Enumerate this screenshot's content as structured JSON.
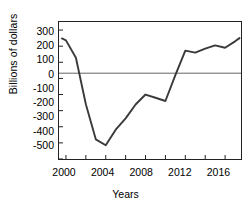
{
  "chart_data": {
    "type": "line",
    "title": "",
    "xlabel": "Years",
    "ylabel": "Billions of dollars",
    "xlim": [
      1999.3,
      2017.6
    ],
    "ylim": [
      -500,
      350
    ],
    "grid": false,
    "legend": "none",
    "zero_line": 0,
    "x_ticks_major": [
      2000,
      2004,
      2008,
      2012,
      2016
    ],
    "x_ticks_minor": [
      2002,
      2006,
      2010,
      2014
    ],
    "x_tick_labels": [
      "2000",
      "2004",
      "2008",
      "2012",
      "2016"
    ],
    "y_ticks": [
      300,
      200,
      100,
      0,
      -100,
      -200,
      -300,
      -400,
      -500
    ],
    "y_tick_labels": [
      "300",
      "200",
      "100",
      "0",
      "-100",
      "-200",
      "-300",
      "-400",
      "-500"
    ],
    "series": [
      {
        "name": "Federal surplus or deficit",
        "color": "#3a3a3a",
        "x": [
          1999.6,
          2000,
          2001,
          2002,
          2003,
          2004,
          2005,
          2006,
          2007,
          2008,
          2009,
          2010,
          2011,
          2012,
          2013,
          2014,
          2015,
          2016,
          2017,
          2017.45
        ],
        "values": [
          248,
          236,
          128,
          -160,
          -378,
          -415,
          -318,
          -248,
          -162,
          -100,
          -120,
          -140,
          20,
          172,
          160,
          185,
          205,
          190,
          230,
          250
        ]
      }
    ]
  },
  "axis": {
    "y_label_text": "Billions of dollars",
    "x_label_text": "Years"
  },
  "colors": {
    "line": "#3a3a3a",
    "axis": "#222222",
    "zero_line": "#555555",
    "text": "#000000",
    "background": "#ffffff"
  }
}
